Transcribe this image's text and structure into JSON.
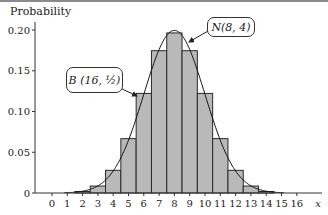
{
  "chart_data": {
    "type": "bar",
    "title": "",
    "xlabel": "x",
    "ylabel": "Probability",
    "categories": [
      0,
      1,
      2,
      3,
      4,
      5,
      6,
      7,
      8,
      9,
      10,
      11,
      12,
      13,
      14,
      15,
      16
    ],
    "values": [
      1.53e-05,
      0.000244,
      0.00183,
      0.00854,
      0.0278,
      0.0667,
      0.1222,
      0.1746,
      0.1964,
      0.1746,
      0.1222,
      0.0667,
      0.0278,
      0.00854,
      0.00183,
      0.000244,
      1.53e-05
    ],
    "series": [
      {
        "name": "B(16, 1/2)",
        "kind": "bar",
        "values": [
          1.53e-05,
          0.000244,
          0.00183,
          0.00854,
          0.0278,
          0.0667,
          0.1222,
          0.1746,
          0.1964,
          0.1746,
          0.1222,
          0.0667,
          0.0278,
          0.00854,
          0.00183,
          0.000244,
          1.53e-05
        ]
      },
      {
        "name": "N(8, 4)",
        "kind": "line",
        "mean": 8,
        "variance": 4
      }
    ],
    "yticks": [
      "0",
      "0.05",
      "0.10",
      "0.15",
      "0.20"
    ],
    "ytick_values": [
      0,
      0.05,
      0.1,
      0.15,
      0.2
    ],
    "xticks": [
      "0",
      "1",
      "2",
      "3",
      "4",
      "5",
      "6",
      "7",
      "8",
      "9",
      "10",
      "11",
      "12",
      "13",
      "14",
      "15",
      "16"
    ],
    "ylim": [
      0,
      0.21
    ],
    "xlim": [
      -1,
      17
    ],
    "grid": false,
    "annotations": [
      {
        "text": "B(16, 1/2)",
        "target": "bar x=6"
      },
      {
        "text": "N(8, 4)",
        "target": "curve near peak"
      }
    ],
    "colors": {
      "bar_fill": "#b9b9b9",
      "bar_stroke": "#2a2a2a",
      "curve": "#111111"
    }
  },
  "axis": {
    "ylabel": "Probability",
    "xlabel": "x"
  },
  "labels": {
    "binomial": "B (16, ½)",
    "normal": "N(8, 4)"
  }
}
